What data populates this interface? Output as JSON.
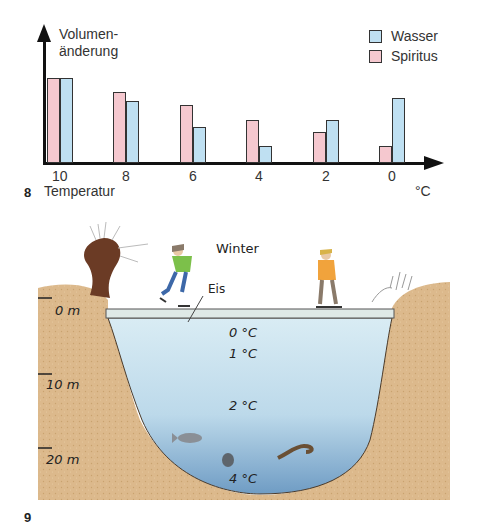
{
  "figure8": {
    "number": "8",
    "ylabel_line1": "Volumen-",
    "ylabel_line2": "änderung",
    "xlabel": "Temperatur",
    "unit": "°C",
    "legend": [
      {
        "label": "Wasser",
        "color": "#bfe0f2"
      },
      {
        "label": "Spiritus",
        "color": "#f5c8cf"
      }
    ]
  },
  "chart_data": {
    "type": "bar",
    "title": "",
    "xlabel": "Temperatur (°C)",
    "ylabel": "Volumenänderung",
    "categories": [
      "10",
      "8",
      "6",
      "4",
      "2",
      "0"
    ],
    "series": [
      {
        "name": "Spiritus",
        "color": "#f5c8cf",
        "values": [
          85,
          71,
          58,
          43,
          31,
          17
        ]
      },
      {
        "name": "Wasser",
        "color": "#bfe0f2",
        "values": [
          85,
          62,
          36,
          17,
          43,
          65
        ]
      }
    ],
    "units_note": "relative heights (no y-axis scale shown)",
    "ylim": [
      0,
      100
    ],
    "grid": false,
    "legend_position": "top-right"
  },
  "figure9": {
    "number": "9",
    "season": "Winter",
    "ice_label": "Eis",
    "depths": [
      "0 m",
      "10 m",
      "20 m"
    ],
    "temperatures": [
      "0 °C",
      "1 °C",
      "2 °C",
      "4 °C"
    ]
  }
}
